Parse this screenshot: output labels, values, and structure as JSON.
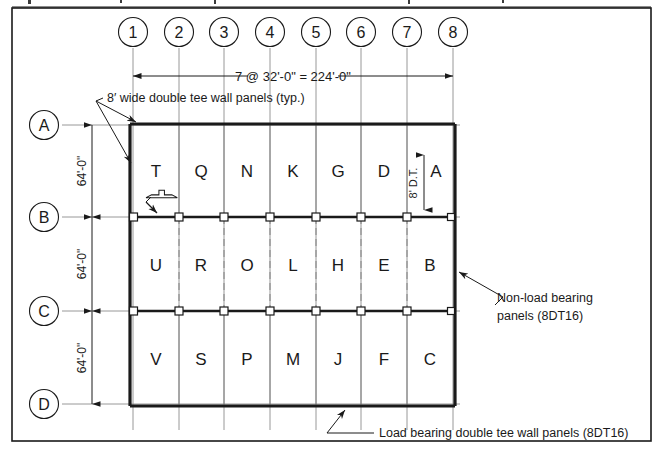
{
  "drawing": {
    "title": "Precast double tee wall panel erection plan",
    "background_color": "#ffffff",
    "ink_color": "#1a1a1a",
    "grid_line_color": "#8c8c8c",
    "border": {
      "present": true,
      "clipped_text_above": true
    }
  },
  "column_grid": {
    "labels": [
      "1",
      "2",
      "3",
      "4",
      "5",
      "6",
      "7",
      "8"
    ],
    "bubble_shape": "circle"
  },
  "row_grid": {
    "labels": [
      "A",
      "B",
      "C",
      "D"
    ],
    "bubble_shape": "circle"
  },
  "dimensions": {
    "overall_horizontal": "7 @ 32'-0\" = 224'-0\"",
    "bay_vertical_1": "64'-0\"",
    "bay_vertical_2": "64'-0\"",
    "bay_vertical_3": "64'-0\"",
    "panel_width_note": "8' D.T."
  },
  "panels": {
    "row_top": [
      "T",
      "Q",
      "N",
      "K",
      "G",
      "D",
      "A"
    ],
    "row_middle": [
      "U",
      "R",
      "O",
      "L",
      "H",
      "E",
      "B"
    ],
    "row_bottom": [
      "V",
      "S",
      "P",
      "M",
      "J",
      "F",
      "C"
    ]
  },
  "annotations": {
    "top_left_note": "8′ wide double tee wall panels (typ.)",
    "right_note_line1": "Non-load bearing",
    "right_note_line2": "panels (8DT16)",
    "bottom_note": "Load bearing double tee wall panels (8DT16)"
  }
}
